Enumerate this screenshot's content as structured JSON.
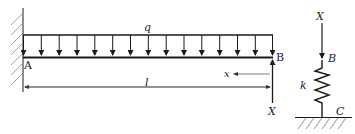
{
  "diagram": {
    "beam": {
      "support_left_label": "A",
      "end_right_label": "B",
      "load_label": "q",
      "length_label": "l",
      "coordinate_label": "x",
      "reaction_label": "X",
      "load_arrow_count": 14
    },
    "spring_model": {
      "force_label": "X",
      "top_point_label": "B",
      "stiffness_label": "k",
      "bottom_point_label": "C"
    },
    "colors": {
      "line": "#1a1a1a",
      "hatch": "#888888",
      "background": "#ffffff"
    }
  }
}
